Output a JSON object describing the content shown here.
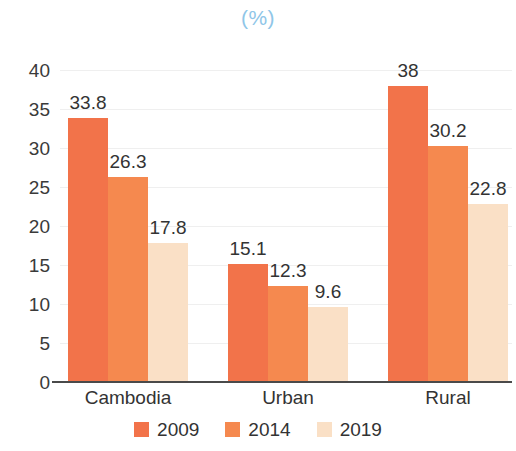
{
  "chart_data": {
    "type": "bar",
    "title": "(%)",
    "xlabel": "",
    "ylabel": "",
    "ylim": [
      0,
      40
    ],
    "ytick_step": 5,
    "yticks": [
      "40",
      "35",
      "30",
      "25",
      "20",
      "15",
      "10",
      "5",
      "0"
    ],
    "grid": true,
    "legend_position": "bottom-center",
    "categories": [
      "Cambodia",
      "Urban",
      "Rural"
    ],
    "series": [
      {
        "name": "2009",
        "color": "#F2734A",
        "values": [
          33.8,
          15.1,
          38
        ],
        "labels": [
          "33.8",
          "15.1",
          "38"
        ]
      },
      {
        "name": "2014",
        "color": "#F5894F",
        "values": [
          26.3,
          12.3,
          30.2
        ],
        "labels": [
          "26.3",
          "12.3",
          "30.2"
        ]
      },
      {
        "name": "2019",
        "color": "#FAE0C6",
        "values": [
          17.8,
          9.6,
          22.8
        ],
        "labels": [
          "17.8",
          "9.6",
          "22.8"
        ]
      }
    ]
  },
  "colors": {
    "title": "#8FC6E8",
    "text": "#333333",
    "axis": "#4a4a4a",
    "gridline": "#EFEFEF",
    "series_2009": "#F2734A",
    "series_2014": "#F5894F",
    "series_2019": "#FAE0C6"
  }
}
